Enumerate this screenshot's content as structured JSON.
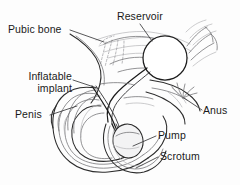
{
  "figure": {
    "background_color": "#fdfdfd",
    "line_color": "#2b2b2b",
    "width": 240,
    "height": 185
  },
  "labels": {
    "pubic_bone": "Pubic bone",
    "reservoir": "Reservoir",
    "inflatable_implant_line1": "Inflatable",
    "inflatable_implant_line2": "implant",
    "penis": "Penis",
    "anus": "Anus",
    "pump": "Pump",
    "scrotum": "Scrotum"
  },
  "parts": [
    {
      "id": "pubic-bone",
      "label": "Pubic bone",
      "label_position": "top-left",
      "leader_from": [
        70,
        30
      ],
      "leader_to": [
        104,
        42
      ]
    },
    {
      "id": "reservoir",
      "label": "Reservoir",
      "label_position": "top-right",
      "shape": "circle",
      "center": [
        165,
        58
      ],
      "radius": 22,
      "leader_from": [
        140,
        24
      ],
      "leader_to": [
        152,
        40
      ]
    },
    {
      "id": "inflatable-implant",
      "label": "Inflatable implant",
      "label_position": "mid-left",
      "leader_from": [
        72,
        80
      ],
      "leader_to": [
        96,
        88
      ]
    },
    {
      "id": "penis",
      "label": "Penis",
      "label_position": "mid-left",
      "leader_from": [
        50,
        115
      ],
      "leader_to": [
        76,
        106
      ]
    },
    {
      "id": "anus",
      "label": "Anus",
      "label_position": "right",
      "leader_from": [
        201,
        111
      ],
      "leader_to": [
        183,
        98
      ]
    },
    {
      "id": "pump",
      "label": "Pump",
      "label_position": "bottom-right",
      "shape": "oval",
      "center": [
        128,
        140
      ],
      "rx": 15,
      "ry": 17,
      "leader_from": [
        156,
        136
      ],
      "leader_to": [
        134,
        146
      ]
    },
    {
      "id": "scrotum",
      "label": "Scrotum",
      "label_position": "bottom-right",
      "leader_from": [
        158,
        157
      ],
      "leader_to": [
        136,
        168
      ]
    }
  ]
}
